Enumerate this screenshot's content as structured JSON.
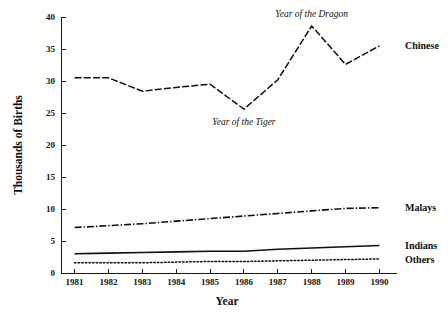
{
  "chart_data": {
    "type": "line",
    "title": "",
    "xlabel": "Year",
    "ylabel": "Thousands of Births",
    "x": [
      1981,
      1982,
      1983,
      1984,
      1985,
      1986,
      1987,
      1988,
      1989,
      1990
    ],
    "categories": [
      "1981",
      "1982",
      "1983",
      "1984",
      "1985",
      "1986",
      "1987",
      "1988",
      "1989",
      "1990"
    ],
    "xlim": [
      1980.6,
      1990.4
    ],
    "ylim": [
      0,
      40
    ],
    "yticks": [
      0,
      5,
      10,
      15,
      20,
      25,
      30,
      35,
      40
    ],
    "ytick_labels": [
      "0",
      "5",
      "10",
      "15",
      "20",
      "25",
      "30",
      "35",
      "40"
    ],
    "grid": false,
    "legend_position": "right-of-line-ends",
    "series": [
      {
        "name": "Chinese",
        "style": "dashed",
        "values": [
          30.5,
          30.5,
          28.4,
          29.0,
          29.5,
          25.6,
          30.2,
          38.6,
          32.6,
          35.5
        ]
      },
      {
        "name": "Malays",
        "style": "dash-dot",
        "values": [
          7.1,
          7.4,
          7.7,
          8.1,
          8.5,
          8.9,
          9.3,
          9.7,
          10.1,
          10.2
        ]
      },
      {
        "name": "Indians",
        "style": "solid",
        "values": [
          3.0,
          3.1,
          3.2,
          3.3,
          3.4,
          3.4,
          3.7,
          3.9,
          4.1,
          4.3
        ]
      },
      {
        "name": "Others",
        "style": "dotted",
        "values": [
          1.6,
          1.6,
          1.6,
          1.7,
          1.8,
          1.8,
          1.9,
          2.0,
          2.1,
          2.2
        ]
      }
    ],
    "annotations": [
      {
        "text": "Year of the Dragon",
        "x": 1988,
        "y": 40.0,
        "style": "italic"
      },
      {
        "text": "Year of the Tiger",
        "x": 1986,
        "y": 23.2,
        "style": "italic"
      }
    ]
  },
  "axis": {
    "y_title": "Thousands of Births",
    "x_title": "Year"
  },
  "series_labels": {
    "chinese": "Chinese",
    "malays": "Malays",
    "indians": "Indians",
    "others": "Others"
  },
  "annotation_labels": {
    "dragon": "Year of the Dragon",
    "tiger": "Year of the Tiger"
  },
  "colors": {
    "ink": "#101010",
    "background": "#fdfdfc"
  }
}
